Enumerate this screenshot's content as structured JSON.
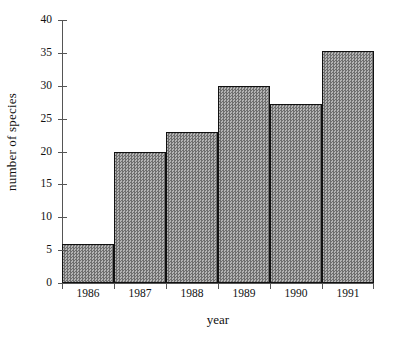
{
  "chart_data": {
    "type": "bar",
    "title": "",
    "xlabel": "year",
    "ylabel": "number of species",
    "categories": [
      "1986",
      "1987",
      "1988",
      "1989",
      "1990",
      "1991"
    ],
    "values": [
      6,
      20,
      23,
      30,
      27.3,
      35.3
    ],
    "series": [
      {
        "name": "number of species",
        "values": [
          6,
          20,
          23,
          30,
          27.3,
          35.3
        ]
      }
    ],
    "ylim": [
      0,
      40
    ],
    "yticks": [
      0,
      5,
      10,
      15,
      20,
      25,
      30,
      35,
      40
    ],
    "ytick_labels": [
      "0",
      "5",
      "10",
      "15",
      "20",
      "25",
      "30",
      "35",
      "40"
    ],
    "grid": false,
    "legend": false,
    "legend_position": "none",
    "bar_fill_color": "#8f8f8f",
    "bar_edge_color": "#111111",
    "axis_color": "#555555",
    "background_color": "#ffffff",
    "bars_contiguous": true
  }
}
